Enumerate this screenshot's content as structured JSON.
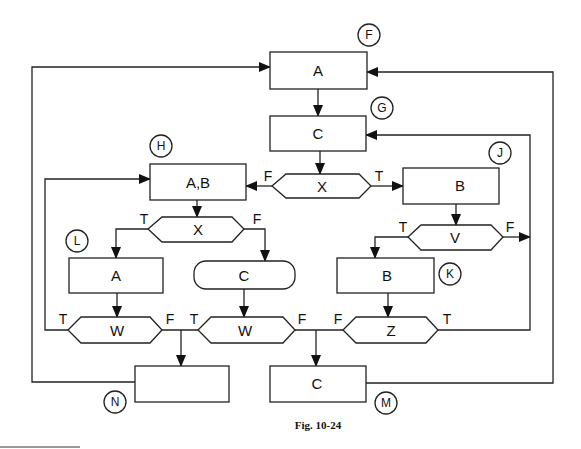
{
  "figure": {
    "caption": "Fig. 10-24",
    "connectors": {
      "F": "F",
      "G": "G",
      "H": "H",
      "J": "J",
      "K": "K",
      "L": "L",
      "M": "M",
      "N": "N"
    },
    "nodes": {
      "box_A_top": "A",
      "box_C_top": "C",
      "dec_X_top": "X",
      "box_AB": "A,B",
      "box_B_right": "B",
      "dec_X_left": "X",
      "dec_V": "V",
      "box_A_L": "A",
      "term_C": "C",
      "box_B_K": "B",
      "dec_W_left": "W",
      "dec_W_mid": "W",
      "dec_Z": "Z",
      "box_N": "",
      "box_M": "C"
    },
    "edge_labels": {
      "xtop_F": "F",
      "xtop_T": "T",
      "xleft_T": "T",
      "xleft_F": "F",
      "v_T": "T",
      "v_F": "F",
      "w1_T": "T",
      "w1_F": "F",
      "w2_T": "T",
      "w2_F": "F",
      "z_F": "F",
      "z_T": "T"
    }
  }
}
